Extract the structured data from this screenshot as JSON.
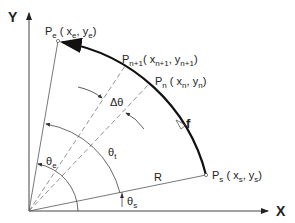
{
  "diagram": {
    "axes": {
      "x_label": "X",
      "y_label": "Y"
    },
    "points": {
      "pe": {
        "name": "P",
        "sub": "e",
        "coords": "( x",
        "cx_sub": "e",
        "mid": ", y",
        "cy_sub": "e",
        "end": ")"
      },
      "pn1": {
        "name": "P",
        "sub": "n+1",
        "coords": "( x",
        "cx_sub": "n+1",
        "mid": ", y",
        "cy_sub": "n+1",
        "end": ")"
      },
      "pn": {
        "name": "P",
        "sub": "n",
        "coords": "( x",
        "cx_sub": "n",
        "mid": ", y",
        "cy_sub": "n",
        "end": ")"
      },
      "ps": {
        "name": "P",
        "sub": "s",
        "coords": "( x",
        "cx_sub": "s",
        "mid": ", y",
        "cy_sub": "s",
        "end": ")"
      }
    },
    "labels": {
      "delta_theta": "Δθ",
      "theta_e": "θ",
      "theta_e_sub": "e",
      "theta_t": "θ",
      "theta_t_sub": "t",
      "theta_s": "θ",
      "theta_s_sub": "s",
      "radius": "R",
      "feed": "f"
    },
    "colors": {
      "line": "#555555",
      "arc": "#111111",
      "text": "#222222"
    }
  }
}
